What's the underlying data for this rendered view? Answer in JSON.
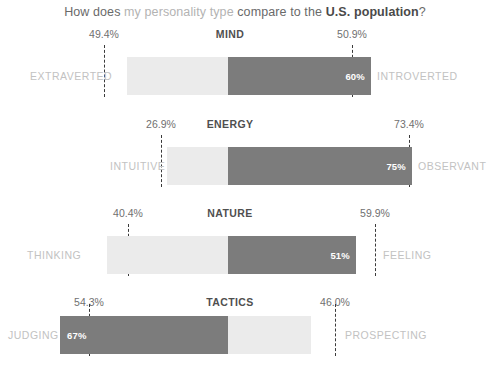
{
  "title": {
    "part1": "How does ",
    "part2": "my personality type",
    "part3": " compare to the ",
    "part4": "U.S. population",
    "part5": "?"
  },
  "colors": {
    "bar_light": "#ebebeb",
    "bar_dark": "#7c7c7c",
    "trait_label": "#c2c2c2",
    "tick_label": "#707070",
    "dash_line": "#3a3a3a",
    "section_title": "#4f4f4f"
  },
  "chart_data": {
    "type": "bar",
    "title": "How does my personality type compare to the U.S. population?",
    "xlabel": "",
    "ylabel": "",
    "orientation": "horizontal",
    "layout": "diverging-stacked",
    "note": "Each trait row is a 100% stacked horizontal bar. The dashed line marks the U.S. population percentage for the highlighted (dark) trait; the bold in-bar label is the user's own personality percentage.",
    "sections": [
      {
        "name": "MIND",
        "left_trait": "EXTRAVERTED",
        "right_trait": "INTROVERTED",
        "left_tick": "49.4%",
        "right_tick": "50.9%",
        "left_tick_value": 49.4,
        "right_tick_value": 50.9,
        "user_value": "60%",
        "user_value_number": 60,
        "highlighted_trait": "INTROVERTED",
        "highlight_side": "right"
      },
      {
        "name": "ENERGY",
        "left_trait": "INTUITIVE",
        "right_trait": "OBSERVANT",
        "left_tick": "26.9%",
        "right_tick": "73.4%",
        "left_tick_value": 26.9,
        "right_tick_value": 73.4,
        "user_value": "75%",
        "user_value_number": 75,
        "highlighted_trait": "OBSERVANT",
        "highlight_side": "right"
      },
      {
        "name": "NATURE",
        "left_trait": "THINKING",
        "right_trait": "FEELING",
        "left_tick": "40.4%",
        "right_tick": "59.9%",
        "left_tick_value": 40.4,
        "right_tick_value": 59.9,
        "user_value": "51%",
        "user_value_number": 51,
        "highlighted_trait": "FEELING",
        "highlight_side": "right"
      },
      {
        "name": "TACTICS",
        "left_trait": "JUDGING",
        "right_trait": "PROSPECTING",
        "left_tick": "54.3%",
        "right_tick": "46.0%",
        "left_tick_value": 54.3,
        "right_tick_value": 46.0,
        "user_value": "67%",
        "user_value_number": 67,
        "highlighted_trait": "JUDGING",
        "highlight_side": "left"
      }
    ]
  },
  "geometry": {
    "sections": [
      {
        "top": 28,
        "bar_top": 57,
        "bar_left": 127,
        "bar_width": 244,
        "split_x": 228,
        "dash_left_x": 104,
        "dash_right_x": 352,
        "dash_top": 45,
        "dash_height": 52,
        "label_left_x": 30,
        "label_right_x": 377,
        "label_y": 76
      },
      {
        "top": 118,
        "bar_top": 147,
        "bar_left": 167,
        "bar_width": 245,
        "split_x": 228,
        "dash_left_x": 161,
        "dash_right_x": 409,
        "dash_top": 135,
        "dash_height": 52,
        "label_left_x": 110,
        "label_right_x": 418,
        "label_y": 166
      },
      {
        "top": 207,
        "bar_top": 236,
        "bar_left": 107,
        "bar_width": 249,
        "split_x": 228,
        "dash_left_x": 128,
        "dash_right_x": 375,
        "dash_top": 224,
        "dash_height": 52,
        "label_left_x": 27,
        "label_right_x": 383,
        "label_y": 255
      },
      {
        "top": 296,
        "bar_top": 316,
        "bar_left": 60,
        "bar_width": 251,
        "split_x": 228,
        "dash_left_x": 89,
        "dash_right_x": 335,
        "dash_top": 304,
        "dash_height": 52,
        "label_left_x": 8,
        "label_right_x": 345,
        "label_y": 335
      }
    ]
  }
}
